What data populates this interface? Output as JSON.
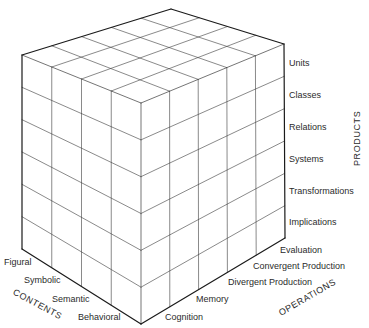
{
  "diagram": {
    "type": "structure-of-intellect-cube",
    "vertices": {
      "top_left": [
        22,
        55
      ],
      "top_back": [
        171,
        9
      ],
      "top_right": [
        284,
        44
      ],
      "top_front": [
        141,
        103
      ],
      "bottom_left": [
        22,
        249
      ],
      "bottom_front": [
        141,
        324
      ],
      "bottom_right": [
        285,
        238
      ]
    },
    "line_color": "#3a3a3a",
    "edge_color": "#1a1a1a"
  },
  "axes": {
    "products": {
      "title": "PRODUCTS",
      "items": [
        "Units",
        "Classes",
        "Relations",
        "Systems",
        "Transformations",
        "Implications"
      ]
    },
    "operations": {
      "title": "OPERATIONS",
      "items": [
        "Evaluation",
        "Convergent Production",
        "Divergent Production",
        "Memory",
        "Cognition"
      ]
    },
    "contents": {
      "title": "CONTENTS",
      "items": [
        "Figural",
        "Symbolic",
        "Semantic",
        "Behavioral"
      ]
    }
  }
}
